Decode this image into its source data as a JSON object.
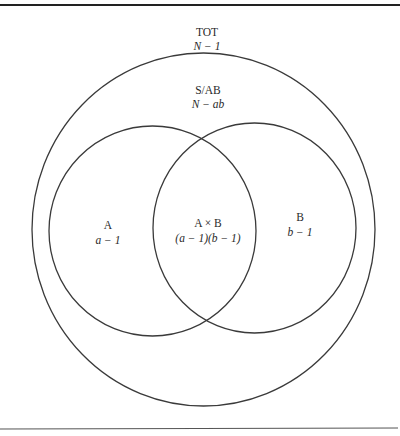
{
  "diagram": {
    "type": "venn",
    "title": "",
    "colors": {
      "line": "#3a3a3a",
      "text": "#2a2a2a",
      "background": "#ffffff"
    },
    "regions": {
      "total": {
        "name": "TOT",
        "df": "N − 1"
      },
      "within": {
        "name": "S/AB",
        "df": "N − ab"
      },
      "a": {
        "name": "A",
        "df": "a − 1"
      },
      "interaction": {
        "name": "A × B",
        "df": "(a − 1)(b − 1)"
      },
      "b": {
        "name": "B",
        "df": "b − 1"
      }
    }
  }
}
